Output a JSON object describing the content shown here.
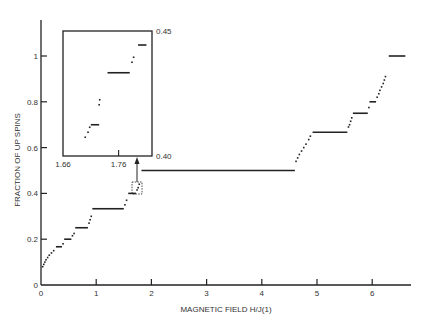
{
  "chart_data": {
    "type": "scatter",
    "title": "",
    "xlabel": "MAGNETIC FIELD H/J(1)",
    "ylabel": "FRACTION OF UP SPINS",
    "xlim": [
      0,
      6.6
    ],
    "ylim": [
      0,
      1.15
    ],
    "x_ticks": [
      "0",
      "1",
      "2",
      "3",
      "4",
      "5",
      "6"
    ],
    "y_ticks": [
      "0",
      "0.2",
      "0.4",
      "0.6",
      "0.8",
      "1"
    ],
    "grid": false,
    "legend": null,
    "plateaus": [
      {
        "x0": 0.27,
        "x1": 0.38,
        "y": 0.167
      },
      {
        "x0": 0.42,
        "x1": 0.55,
        "y": 0.2
      },
      {
        "x0": 0.62,
        "x1": 0.85,
        "y": 0.25
      },
      {
        "x0": 0.93,
        "x1": 1.5,
        "y": 0.333
      },
      {
        "x0": 1.58,
        "x1": 1.72,
        "y": 0.4
      },
      {
        "x0": 1.82,
        "x1": 4.6,
        "y": 0.5
      },
      {
        "x0": 4.92,
        "x1": 5.55,
        "y": 0.667
      },
      {
        "x0": 5.65,
        "x1": 5.92,
        "y": 0.75
      },
      {
        "x0": 5.95,
        "x1": 6.07,
        "y": 0.8
      },
      {
        "x0": 6.3,
        "x1": 6.6,
        "y": 1.0
      }
    ],
    "points": [
      {
        "x": 0.03,
        "y": 0.08
      },
      {
        "x": 0.05,
        "y": 0.09
      },
      {
        "x": 0.07,
        "y": 0.1
      },
      {
        "x": 0.09,
        "y": 0.11
      },
      {
        "x": 0.12,
        "y": 0.12
      },
      {
        "x": 0.15,
        "y": 0.13
      },
      {
        "x": 0.19,
        "y": 0.14
      },
      {
        "x": 0.23,
        "y": 0.15
      },
      {
        "x": 0.4,
        "y": 0.18
      },
      {
        "x": 0.57,
        "y": 0.215
      },
      {
        "x": 0.6,
        "y": 0.225
      },
      {
        "x": 0.87,
        "y": 0.27
      },
      {
        "x": 0.89,
        "y": 0.285
      },
      {
        "x": 0.91,
        "y": 0.3
      },
      {
        "x": 1.52,
        "y": 0.35
      },
      {
        "x": 1.55,
        "y": 0.37
      },
      {
        "x": 1.74,
        "y": 0.415
      },
      {
        "x": 1.76,
        "y": 0.425
      },
      {
        "x": 1.78,
        "y": 0.44
      },
      {
        "x": 4.62,
        "y": 0.54
      },
      {
        "x": 4.65,
        "y": 0.555
      },
      {
        "x": 4.68,
        "y": 0.57
      },
      {
        "x": 4.72,
        "y": 0.585
      },
      {
        "x": 4.76,
        "y": 0.6
      },
      {
        "x": 4.8,
        "y": 0.615
      },
      {
        "x": 4.85,
        "y": 0.635
      },
      {
        "x": 4.88,
        "y": 0.65
      },
      {
        "x": 5.57,
        "y": 0.69
      },
      {
        "x": 5.59,
        "y": 0.7
      },
      {
        "x": 5.61,
        "y": 0.715
      },
      {
        "x": 5.63,
        "y": 0.73
      },
      {
        "x": 5.94,
        "y": 0.775
      },
      {
        "x": 6.09,
        "y": 0.82
      },
      {
        "x": 6.12,
        "y": 0.835
      },
      {
        "x": 6.14,
        "y": 0.85
      },
      {
        "x": 6.17,
        "y": 0.865
      },
      {
        "x": 6.2,
        "y": 0.88
      },
      {
        "x": 6.22,
        "y": 0.895
      },
      {
        "x": 6.24,
        "y": 0.91
      }
    ],
    "inset": {
      "xlim": [
        1.66,
        1.82
      ],
      "ylim": [
        0.4,
        0.45
      ],
      "x_ticks": [
        "1.66",
        "1.76"
      ],
      "y_ticks": [
        "0.40",
        "0.45"
      ],
      "plateaus": [
        {
          "x0": 1.71,
          "x1": 1.725,
          "y": 0.4125
        },
        {
          "x0": 1.74,
          "x1": 1.78,
          "y": 0.4333
        },
        {
          "x0": 1.795,
          "x1": 1.81,
          "y": 0.4444
        }
      ],
      "points": [
        {
          "x": 1.7,
          "y": 0.4075
        },
        {
          "x": 1.705,
          "y": 0.4095
        },
        {
          "x": 1.708,
          "y": 0.4115
        },
        {
          "x": 1.725,
          "y": 0.4205
        },
        {
          "x": 1.726,
          "y": 0.4225
        },
        {
          "x": 1.784,
          "y": 0.4375
        },
        {
          "x": 1.787,
          "y": 0.4395
        }
      ],
      "zoom_box": {
        "x0": 1.66,
        "x1": 1.82,
        "y0": 0.4,
        "y1": 0.45
      }
    }
  }
}
